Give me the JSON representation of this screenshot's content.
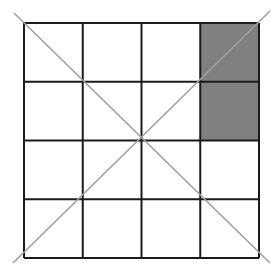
{
  "diagram": {
    "type": "grid",
    "rows": 4,
    "cols": 4,
    "origin": [
      24,
      23
    ],
    "cell_size": 58.75,
    "shaded_cells": [
      [
        0,
        3
      ],
      [
        1,
        3
      ]
    ],
    "shade_color": "#808080",
    "grid_line_color": "#1a1a1a",
    "diagonal_color": "#a0a0a0",
    "diagonals": [
      {
        "x1": 14,
        "y1": 13,
        "x2": 270,
        "y2": 263
      },
      {
        "x1": 270,
        "y1": 11,
        "x2": 13,
        "y2": 263
      }
    ]
  }
}
